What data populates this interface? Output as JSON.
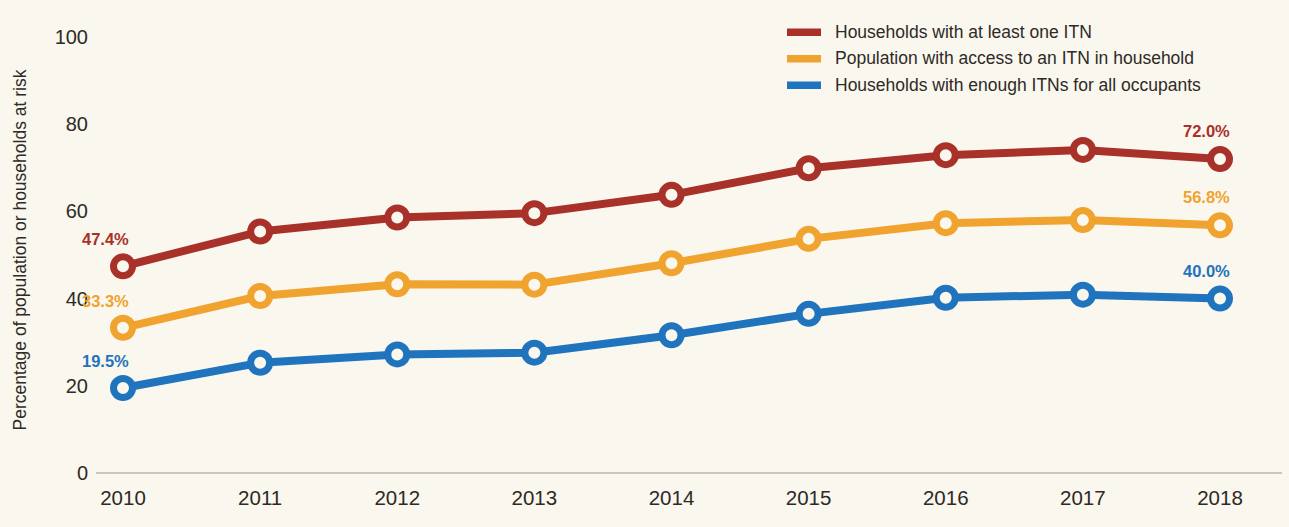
{
  "chart_data": {
    "type": "line",
    "title": "",
    "xlabel": "",
    "ylabel": "Percentage of population or households at risk",
    "categories": [
      "2010",
      "2011",
      "2012",
      "2013",
      "2014",
      "2015",
      "2016",
      "2017",
      "2018"
    ],
    "x": [
      2010,
      2011,
      2012,
      2013,
      2014,
      2015,
      2016,
      2017,
      2018
    ],
    "ylim": [
      0,
      100
    ],
    "yticks": [
      0,
      20,
      40,
      60,
      80,
      100
    ],
    "grid": false,
    "legend_position": "top-right",
    "series": [
      {
        "name": "Households with at least one ITN",
        "color": "#a8312a",
        "values": [
          47.4,
          55.4,
          58.6,
          59.6,
          63.8,
          69.9,
          72.9,
          74.1,
          72.0
        ],
        "start_label": "47.4%",
        "end_label": "72.0%"
      },
      {
        "name": "Population with access to an ITN in household",
        "color": "#f0a32e",
        "values": [
          33.3,
          40.6,
          43.3,
          43.2,
          48.1,
          53.7,
          57.3,
          58.0,
          56.8
        ],
        "start_label": "33.3%",
        "end_label": "56.8%"
      },
      {
        "name": "Households with enough ITNs for all occupants",
        "color": "#1f74bd",
        "values": [
          19.5,
          25.3,
          27.2,
          27.6,
          31.6,
          36.5,
          40.2,
          40.9,
          40.0
        ],
        "start_label": "19.5%",
        "end_label": "40.0%"
      }
    ]
  },
  "legend": {
    "items": [
      {
        "label": "Households with at least one ITN",
        "color": "#a8312a"
      },
      {
        "label": "Population with access to an ITN in household",
        "color": "#f0a32e"
      },
      {
        "label": "Households with enough ITNs for all occupants",
        "color": "#1f74bd"
      }
    ]
  },
  "axes": {
    "y_title": "Percentage of population or households at risk",
    "y_ticks": [
      "100",
      "80",
      "60",
      "40",
      "20",
      "0"
    ],
    "x_ticks": [
      "2010",
      "2011",
      "2012",
      "2013",
      "2014",
      "2015",
      "2016",
      "2017",
      "2018"
    ]
  },
  "value_labels": {
    "left": [
      "47.4%",
      "33.3%",
      "19.5%"
    ],
    "right": [
      "72.0%",
      "56.8%",
      "40.0%"
    ]
  },
  "colors": {
    "background": "#faf7ee",
    "series_red": "#a8312a",
    "series_orange": "#f0a32e",
    "series_blue": "#1f74bd",
    "axis": "#c9c6bc",
    "text": "#2e2a26"
  }
}
